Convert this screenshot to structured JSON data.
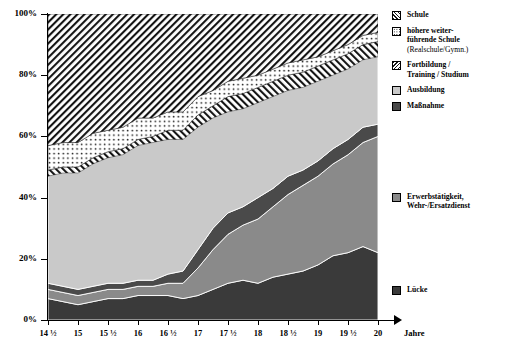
{
  "chart_data": {
    "type": "area",
    "stacked": true,
    "percent": true,
    "title": "",
    "xlabel": "Jahre",
    "ylabel": "",
    "ylim": [
      0,
      100
    ],
    "ytick_labels": [
      "0%",
      "20%",
      "40%",
      "60%",
      "80%",
      "100%"
    ],
    "ytick_values": [
      0,
      20,
      40,
      60,
      80,
      100
    ],
    "grid": false,
    "legend_position": "right",
    "x": [
      14.5,
      14.75,
      15,
      15.25,
      15.5,
      15.75,
      16,
      16.25,
      16.5,
      16.75,
      17,
      17.25,
      17.5,
      17.75,
      18,
      18.25,
      18.5,
      18.75,
      19,
      19.25,
      19.5,
      19.75,
      20
    ],
    "xtick_labels": [
      "14 ½",
      "15",
      "15 ½",
      "16",
      "16 ½",
      "17",
      "17 ½",
      "18",
      "18 ½",
      "19",
      "19 ½",
      "20"
    ],
    "xtick_values": [
      14.5,
      15,
      15.5,
      16,
      16.5,
      17,
      17.5,
      18,
      18.5,
      19,
      19.5,
      20
    ],
    "series": [
      {
        "name": "Lücke",
        "key": "luecke",
        "color": "#3a3a3a",
        "pattern": "solid",
        "values": [
          7,
          6,
          5,
          6,
          7,
          7,
          8,
          8,
          8,
          7,
          8,
          10,
          12,
          13,
          12,
          14,
          15,
          16,
          18,
          21,
          22,
          24,
          22
        ]
      },
      {
        "name": "Erwerbstätigkeit, Wehr-/Ersatzdienst",
        "key": "erwerb",
        "color": "#8a8a8a",
        "pattern": "solid",
        "values": [
          3,
          3,
          3,
          3,
          3,
          3,
          3,
          3,
          4,
          5,
          9,
          13,
          16,
          18,
          21,
          23,
          26,
          28,
          29,
          30,
          32,
          34,
          38
        ]
      },
      {
        "name": "Maßnahme",
        "key": "massnahme",
        "color": "#4a4a4a",
        "pattern": "solid",
        "values": [
          2,
          2,
          2,
          2,
          2,
          2,
          2,
          2,
          3,
          4,
          6,
          7,
          7,
          6,
          7,
          6,
          6,
          5,
          5,
          5,
          5,
          5,
          4
        ]
      },
      {
        "name": "Ausbildung",
        "key": "ausbildung",
        "color": "#c9c9c9",
        "pattern": "solid",
        "values": [
          35,
          37,
          38,
          40,
          41,
          42,
          44,
          45,
          44,
          43,
          40,
          36,
          33,
          32,
          31,
          30,
          28,
          27,
          26,
          24,
          23,
          22,
          22
        ]
      },
      {
        "name": "Fortbildung / Training / Studium",
        "key": "fortbildung",
        "color": "#ffffff",
        "pattern": "diagonal-hatch-back",
        "values": [
          2,
          2,
          2,
          2,
          2,
          2,
          2,
          2,
          3,
          3,
          4,
          4,
          5,
          5,
          5,
          5,
          5,
          5,
          5,
          5,
          5,
          5,
          5
        ]
      },
      {
        "name": "höhere weiterführende Schule (Realschule/Gymn.)",
        "key": "hoehere",
        "color": "#ffffff",
        "pattern": "dotted",
        "values": [
          8,
          8,
          8,
          8,
          7,
          7,
          7,
          6,
          6,
          6,
          6,
          5,
          5,
          5,
          4,
          4,
          4,
          4,
          3,
          3,
          3,
          3,
          3
        ]
      },
      {
        "name": "Schule",
        "key": "schule",
        "color": "#ffffff",
        "pattern": "diagonal-hatch",
        "values": [
          43,
          42,
          42,
          39,
          38,
          37,
          34,
          34,
          32,
          32,
          27,
          25,
          22,
          21,
          20,
          18,
          16,
          15,
          14,
          12,
          10,
          7,
          6
        ]
      }
    ]
  },
  "legend": {
    "top_items": [
      {
        "label": "Schule",
        "sub": "",
        "swatch": "sw-schule",
        "icon": "hatch-swatch-icon"
      },
      {
        "label": "höhere weiter-",
        "label2": "führende Schule",
        "sub": "(Realschule/Gymn.)",
        "swatch": "sw-hoehere",
        "icon": "dotted-swatch-icon"
      },
      {
        "label": "Fortbildung /",
        "label2": "Training / Studium",
        "sub": "",
        "swatch": "sw-fort",
        "icon": "back-hatch-swatch-icon"
      },
      {
        "label": "Ausbildung",
        "sub": "",
        "swatch": "sw-ausb",
        "icon": "light-gray-swatch-icon"
      },
      {
        "label": "Maßnahme",
        "sub": "",
        "swatch": "sw-massn",
        "icon": "dark-gray-swatch-icon"
      }
    ],
    "mid_item": {
      "label": "Erwerbstätigkeit,",
      "label2": "Wehr-/Ersatzdienst",
      "swatch": "sw-erwerb",
      "icon": "gray-swatch-icon"
    },
    "low_item": {
      "label": "Lücke",
      "swatch": "sw-luecke",
      "icon": "black-swatch-icon"
    }
  },
  "axis": {
    "x_title": "Jahre"
  }
}
